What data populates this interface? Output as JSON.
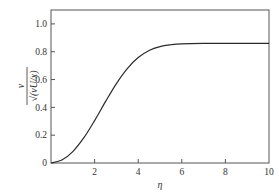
{
  "chart_data": {
    "type": "line",
    "title": "",
    "xlabel": "η",
    "ylabel_numerator": "v",
    "ylabel_denominator": "√(νU/x)",
    "ylabel": "v / √(νU/x)",
    "xlim": [
      0,
      10
    ],
    "ylim": [
      0,
      1.1
    ],
    "grid": false,
    "legend": null,
    "x_ticks": [
      2,
      4,
      6,
      8,
      10
    ],
    "x_tick_labels": [
      "2",
      "4",
      "6",
      "8",
      "10"
    ],
    "y_ticks": [
      0,
      0.2,
      0.4,
      0.6,
      0.8,
      1.0
    ],
    "y_tick_labels": [
      "0",
      "0.2",
      "0.4",
      "0.6",
      "0.8",
      "1.0"
    ],
    "series": [
      {
        "name": "Blasius normal velocity",
        "x": [
          0,
          0.5,
          1.0,
          1.5,
          2.0,
          2.5,
          3.0,
          3.5,
          4.0,
          4.5,
          5.0,
          5.5,
          6.0,
          7.0,
          8.0,
          9.0,
          10.0
        ],
        "y": [
          0,
          0.021,
          0.082,
          0.18,
          0.305,
          0.441,
          0.571,
          0.679,
          0.758,
          0.809,
          0.837,
          0.85,
          0.857,
          0.86,
          0.86,
          0.86,
          0.86
        ]
      }
    ]
  },
  "colors": {
    "line": "#2a2a2a",
    "axis": "#555555",
    "background": "#ffffff"
  }
}
